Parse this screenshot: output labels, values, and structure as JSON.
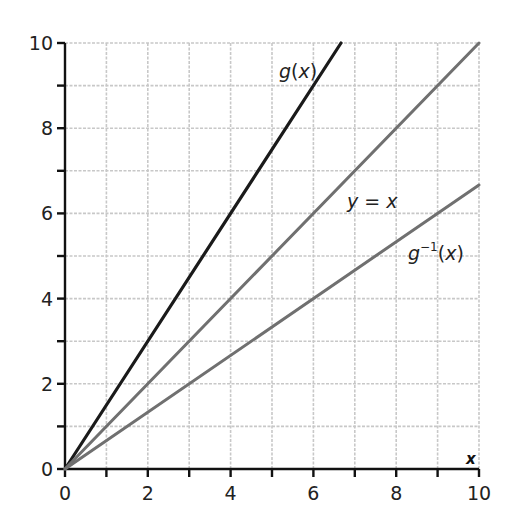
{
  "chart_data": {
    "type": "line",
    "title": "",
    "xlabel": "x",
    "ylabel": "",
    "xlim": [
      0,
      10
    ],
    "ylim": [
      0,
      10
    ],
    "grid": true,
    "grid_step": 1,
    "x_ticks": [
      0,
      2,
      4,
      6,
      8,
      10
    ],
    "y_ticks": [
      0,
      2,
      4,
      6,
      8,
      10
    ],
    "minor_ticks": [
      1,
      3,
      5,
      7,
      9
    ],
    "legend": "inline labels",
    "series": [
      {
        "name": "g(x)",
        "label_main": "g",
        "label_paren_open": "(",
        "label_var": "x",
        "label_paren_close": ")",
        "color": "#1a1a1a",
        "points": [
          [
            0,
            0
          ],
          [
            6.667,
            10
          ]
        ],
        "formula": "y = 1.5x"
      },
      {
        "name": "y = x",
        "label_lhs": "y",
        "label_eq": " = ",
        "label_rhs": "x",
        "color": "#707070",
        "points": [
          [
            0,
            0
          ],
          [
            10,
            10
          ]
        ],
        "formula": "y = x"
      },
      {
        "name": "g^-1(x)",
        "label_main": "g",
        "label_sup": "−1",
        "label_paren_open": "(",
        "label_var": "x",
        "label_paren_close": ")",
        "color": "#707070",
        "points": [
          [
            0,
            0
          ],
          [
            10,
            6.667
          ]
        ],
        "formula": "y = (2/3)x"
      }
    ]
  },
  "axes": {
    "x_tick_labels": [
      "0",
      "2",
      "4",
      "6",
      "8",
      "10"
    ],
    "y_tick_labels": [
      "0",
      "2",
      "4",
      "6",
      "8",
      "10"
    ],
    "x_axis_label": "x"
  },
  "colors": {
    "axis": "#111111",
    "grid": "#c8c8c8",
    "g": "#1a1a1a",
    "identity": "#707070",
    "inverse": "#707070"
  }
}
